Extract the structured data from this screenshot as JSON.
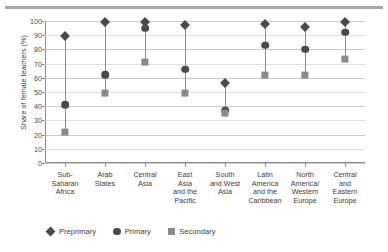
{
  "chart_data": {
    "type": "scatter",
    "title": "",
    "xlabel": "",
    "ylabel": "Share of female teachers (%)",
    "ylim": [
      0,
      100
    ],
    "ytick_step": 10,
    "grid": true,
    "legend_position": "bottom-left",
    "categories": [
      "Sub-Saharan Africa",
      "Arab States",
      "Central Asia",
      "East Asia and the Pacific",
      "South and West Asia",
      "Latin America and the Caribbean",
      "North America/Western Europe",
      "Central and Eastern Europe"
    ],
    "category_lines": [
      [
        "Sub-",
        "Saharan",
        "Africa"
      ],
      [
        "Arab",
        "States"
      ],
      [
        "Central",
        "Asia"
      ],
      [
        "East",
        "Asia",
        "and the",
        "Pacific"
      ],
      [
        "South",
        "and West",
        "Asia"
      ],
      [
        "Latin",
        "America",
        "and the",
        "Caribbean"
      ],
      [
        "North",
        "America/",
        "Western",
        "Europe"
      ],
      [
        "Central",
        "and",
        "Eastern",
        "Europe"
      ]
    ],
    "ytick_labels": [
      "0",
      "10",
      "20",
      "30",
      "40",
      "50",
      "60",
      "70",
      "80",
      "90",
      "100"
    ],
    "series": [
      {
        "name": "Preprimary",
        "marker": "diamond",
        "color": "#4a4a4a",
        "values": [
          89,
          99,
          99,
          97,
          56,
          98,
          96,
          99
        ]
      },
      {
        "name": "Primary",
        "marker": "circle",
        "color": "#4a4a4a",
        "values": [
          41,
          62,
          95,
          66,
          37,
          83,
          80,
          92
        ]
      },
      {
        "name": "Secondary",
        "marker": "square",
        "color": "#8a8a8a",
        "values": [
          22,
          49,
          71,
          49,
          35,
          62,
          62,
          73
        ]
      }
    ]
  },
  "legend": {
    "items": [
      {
        "label": "Preprimary",
        "marker": "diamond"
      },
      {
        "label": "Primary",
        "marker": "circle"
      },
      {
        "label": "Secondary",
        "marker": "square"
      }
    ]
  },
  "axis": {
    "y_title": "Share of female teachers (%)"
  },
  "colors": {
    "dark_marker": "#4a4a4a",
    "light_marker": "#8a8a8a",
    "stem": "#8e8e8e",
    "grid": "#c9c9c9",
    "axis": "#8c8c8c",
    "top_rule": "#a8a8a8"
  }
}
